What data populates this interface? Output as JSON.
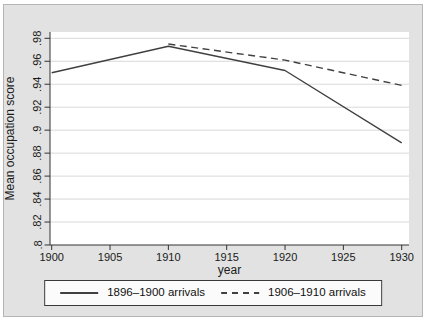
{
  "figure": {
    "background_color": "#e2e2e2",
    "plot_background_color": "#ffffff",
    "grid_color": "#d9d9d9",
    "axis_color": "#333333",
    "text_color": "#1a1a1a",
    "series_color": "#404040"
  },
  "chart_data": {
    "type": "line",
    "title": "",
    "xlabel": "year",
    "ylabel": "Mean occupation score",
    "xlim": [
      1900,
      1930
    ],
    "ylim": [
      0.8,
      0.98
    ],
    "grid": true,
    "legend_position": "bottom",
    "x_ticks": [
      1900,
      1905,
      1910,
      1915,
      1920,
      1925,
      1930
    ],
    "y_tick_labels": [
      ".8",
      ".82",
      ".84",
      ".86",
      ".88",
      ".9",
      ".92",
      ".94",
      ".96",
      ".98"
    ],
    "y_tick_values": [
      0.8,
      0.82,
      0.84,
      0.86,
      0.88,
      0.9,
      0.92,
      0.94,
      0.96,
      0.98
    ],
    "series": [
      {
        "name": "1896–1900 arrivals",
        "line_style": "solid",
        "color": "#404040",
        "x": [
          1900,
          1910,
          1920,
          1930
        ],
        "y": [
          0.95,
          0.973,
          0.952,
          0.889
        ]
      },
      {
        "name": "1906–1910 arrivals",
        "line_style": "dashed",
        "color": "#404040",
        "x": [
          1910,
          1920,
          1930
        ],
        "y": [
          0.975,
          0.961,
          0.939
        ]
      }
    ]
  }
}
